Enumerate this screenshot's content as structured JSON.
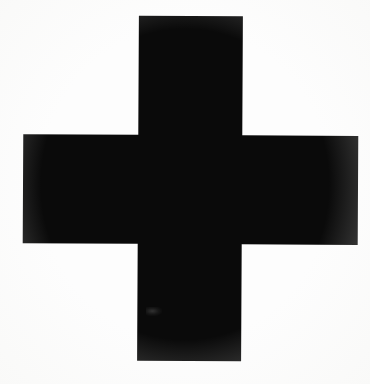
{
  "image": {
    "title": "Black cross symbol",
    "subject": "cross-shape",
    "description": "Solid black plus / cross mark centered on a plain white background",
    "width": 370,
    "height": 384,
    "orientation": "upright",
    "rotation_degrees": 0.3
  },
  "colors": {
    "figure": "#0a0a0a",
    "background": "#fdfdfd",
    "page": "#ffffff",
    "smudge": "#2a2a2a"
  },
  "geometry": {
    "vertical_bar": {
      "name": "vertical-bar",
      "x": 137,
      "y": 17,
      "width": 104,
      "height": 345
    },
    "horizontal_bar": {
      "name": "horizontal-bar",
      "x": 22,
      "y": 136,
      "width": 335,
      "height": 109
    },
    "center": {
      "x": 189,
      "y": 190
    },
    "arms": {
      "top_length": 119,
      "bottom_length": 117,
      "left_length": 115,
      "right_length": 116
    },
    "polygon_points": "137,17 241,17 241,136 357,136 357,245 241,245 241,362 137,362 137,245 22,245 22,136 137,136"
  },
  "artifacts": {
    "smudge": {
      "name": "scan-smudge",
      "x": 146,
      "y": 307,
      "width": 16,
      "height": 9,
      "note": "faint lighter mark inside lower stem"
    }
  }
}
